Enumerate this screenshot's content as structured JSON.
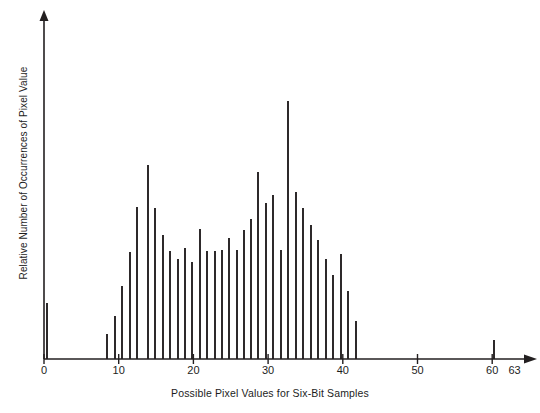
{
  "figure": {
    "background_color": "#ffffff",
    "ink_color": "#231f20"
  },
  "axes": {
    "x_axis": {
      "label": "Possible Pixel Values for Six-Bit Samples",
      "tick_values": [
        0,
        10,
        20,
        30,
        40,
        50,
        60,
        63
      ],
      "tick_labels": [
        "0",
        "10",
        "20",
        "30",
        "40",
        "50",
        "60",
        "63"
      ],
      "range": [
        0,
        65
      ],
      "origin_px": 44,
      "px_per_unit": 7.47,
      "baseline_px": 359,
      "arrow": true
    },
    "y_axis": {
      "label": "Relative Number of Occurrences of Pixel Value",
      "tick_values": [],
      "tick_labels": [],
      "arrow": true,
      "top_px": 10,
      "x_px": 44
    }
  },
  "chart_data": {
    "type": "bar",
    "title": "",
    "subtitle": "",
    "xlabel": "Possible Pixel Values for Six-Bit Samples",
    "ylabel": "Relative Number of Occurrences of Pixel Value",
    "xlim": [
      0,
      65
    ],
    "ylim": [
      0,
      100
    ],
    "grid": false,
    "legend": null,
    "bar_style": "thin-vertical-lines",
    "note": "Values are relative occurrence counts estimated from bar heights (arbitrary units, 0-100 scale).",
    "categories": [
      0,
      9,
      10,
      11,
      12,
      13,
      14,
      15,
      16,
      17,
      18,
      19,
      20,
      21,
      22,
      23,
      24,
      25,
      26,
      27,
      28,
      29,
      30,
      31,
      32,
      33,
      34,
      35,
      36,
      37,
      38,
      39,
      40,
      41,
      42,
      63
    ],
    "values": [
      22,
      9,
      17,
      30,
      45,
      64,
      75,
      63,
      52,
      43,
      40,
      37,
      34,
      50,
      43,
      43,
      43,
      47,
      42,
      54,
      60,
      68,
      56,
      43,
      60,
      100,
      58,
      53,
      46,
      40,
      34,
      27,
      34,
      21,
      13,
      8
    ],
    "points": [
      {
        "x": 0,
        "y": 22,
        "top_px": 303,
        "x_px": 47
      },
      {
        "x": 9,
        "y": 9,
        "top_px": 334,
        "x_px": 107
      },
      {
        "x": 10,
        "y": 17,
        "top_px": 316,
        "x_px": 115
      },
      {
        "x": 11,
        "y": 30,
        "top_px": 286,
        "x_px": 122
      },
      {
        "x": 12,
        "y": 45,
        "top_px": 252,
        "x_px": 130
      },
      {
        "x": 13,
        "y": 64,
        "top_px": 207,
        "x_px": 137
      },
      {
        "x": 14,
        "y": 75,
        "top_px": 165,
        "x_px": 148
      },
      {
        "x": 15,
        "y": 63,
        "top_px": 208,
        "x_px": 155
      },
      {
        "x": 16,
        "y": 52,
        "top_px": 235,
        "x_px": 163
      },
      {
        "x": 17,
        "y": 43,
        "top_px": 251,
        "x_px": 170
      },
      {
        "x": 18,
        "y": 40,
        "top_px": 259,
        "x_px": 178
      },
      {
        "x": 19,
        "y": 37,
        "top_px": 248,
        "x_px": 185
      },
      {
        "x": 20,
        "y": 34,
        "top_px": 262,
        "x_px": 192
      },
      {
        "x": 21,
        "y": 50,
        "top_px": 229,
        "x_px": 200
      },
      {
        "x": 22,
        "y": 43,
        "top_px": 251,
        "x_px": 207
      },
      {
        "x": 23,
        "y": 43,
        "top_px": 251,
        "x_px": 215
      },
      {
        "x": 24,
        "y": 43,
        "top_px": 250,
        "x_px": 222
      },
      {
        "x": 25,
        "y": 47,
        "top_px": 238,
        "x_px": 229
      },
      {
        "x": 26,
        "y": 42,
        "top_px": 250,
        "x_px": 237
      },
      {
        "x": 27,
        "y": 54,
        "top_px": 230,
        "x_px": 244
      },
      {
        "x": 28,
        "y": 60,
        "top_px": 219,
        "x_px": 251
      },
      {
        "x": 29,
        "y": 68,
        "top_px": 172,
        "x_px": 258
      },
      {
        "x": 30,
        "y": 56,
        "top_px": 195,
        "x_px": 273
      },
      {
        "x": 31,
        "y": 43,
        "top_px": 250,
        "x_px": 281
      },
      {
        "x": 32,
        "y": 60,
        "top_px": 203,
        "x_px": 266
      },
      {
        "x": 33,
        "y": 100,
        "top_px": 101,
        "x_px": 288
      },
      {
        "x": 34,
        "y": 58,
        "top_px": 192,
        "x_px": 296
      },
      {
        "x": 35,
        "y": 53,
        "top_px": 208,
        "x_px": 303
      },
      {
        "x": 36,
        "y": 46,
        "top_px": 225,
        "x_px": 311
      },
      {
        "x": 37,
        "y": 40,
        "top_px": 240,
        "x_px": 318
      },
      {
        "x": 38,
        "y": 34,
        "top_px": 259,
        "x_px": 326
      },
      {
        "x": 39,
        "y": 27,
        "top_px": 275,
        "x_px": 333
      },
      {
        "x": 40,
        "y": 34,
        "top_px": 254,
        "x_px": 341
      },
      {
        "x": 41,
        "y": 21,
        "top_px": 291,
        "x_px": 348
      },
      {
        "x": 42,
        "y": 13,
        "top_px": 321,
        "x_px": 356
      },
      {
        "x": 63,
        "y": 8,
        "top_px": 340,
        "x_px": 494
      }
    ]
  }
}
